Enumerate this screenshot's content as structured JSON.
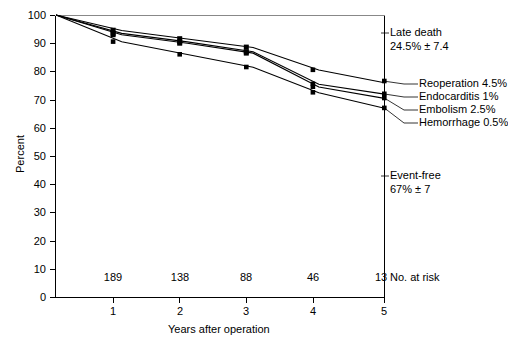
{
  "chart_data": {
    "type": "line",
    "title": "",
    "xlabel": "Years after operation",
    "ylabel": "Percent",
    "xlim": [
      0,
      5
    ],
    "ylim": [
      0,
      100
    ],
    "x_ticks": [
      "1",
      "2",
      "3",
      "4",
      "5"
    ],
    "y_ticks": [
      "0",
      "10",
      "20",
      "30",
      "40",
      "50",
      "60",
      "70",
      "80",
      "90",
      "100"
    ],
    "grid": false,
    "legend": "right-side inline annotations",
    "x": [
      0,
      1,
      2,
      3,
      4,
      5
    ],
    "series": [
      {
        "name": "Reoperation 4.5%",
        "values": [
          100,
          94.5,
          91.5,
          88.5,
          80.5,
          76.0
        ]
      },
      {
        "name": "Endocarditis 1%",
        "values": [
          100,
          93.5,
          90.5,
          87.0,
          75.5,
          72.0
        ]
      },
      {
        "name": "Embolism 2.5%",
        "values": [
          100,
          93.0,
          90.0,
          86.5,
          74.5,
          70.5
        ]
      },
      {
        "name": "Hemorrhage 0.5%",
        "values": [
          100,
          90.5,
          86.0,
          81.5,
          72.5,
          67.0
        ]
      }
    ],
    "numbers_at_risk": [
      "189",
      "138",
      "88",
      "46",
      "13"
    ],
    "numbers_at_risk_label": "No. at risk",
    "annotations": [
      {
        "label": "Late death",
        "value": "24.5% ± 7.4"
      },
      {
        "label": "Event-free",
        "value": "67% ± 7"
      }
    ]
  },
  "axes": {
    "y_label": "Percent",
    "x_label": "Years after operation",
    "y_ticks": [
      "100",
      "90",
      "80",
      "70",
      "60",
      "50",
      "40",
      "30",
      "20",
      "10",
      "0"
    ],
    "x_ticks": [
      "1",
      "2",
      "3",
      "4",
      "5"
    ]
  },
  "risk_row": {
    "label": "No. at risk",
    "values": [
      "189",
      "138",
      "88",
      "46",
      "13"
    ]
  },
  "callouts": {
    "late_death_title": "Late death",
    "late_death_value": "24.5% ± 7.4",
    "event_free_title": "Event-free",
    "event_free_value": "67% ± 7",
    "curve_labels": [
      "Reoperation 4.5%",
      "Endocarditis 1%",
      "Embolism 2.5%",
      "Hemorrhage 0.5%"
    ]
  },
  "colors": {
    "ink": "#000000",
    "background": "#ffffff"
  }
}
